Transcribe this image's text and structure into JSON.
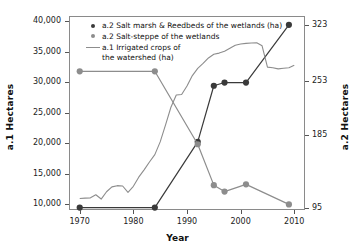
{
  "chart_data": {
    "type": "line",
    "title": "",
    "xlabel": "Year",
    "ylabel": "a.1 Hectares",
    "ylabel_right": "a.2 Hectares",
    "xlim": [
      1968,
      2012
    ],
    "ylim": [
      9000,
      40900
    ],
    "ylim_right": [
      92,
      334
    ],
    "grid": false,
    "legend_position": "top-left inside plot",
    "x_ticks": [
      1970,
      1980,
      1990,
      2000,
      2010
    ],
    "x_tick_labels": [
      "1970",
      "1980",
      "1990",
      "2000",
      "2010"
    ],
    "y_ticks_left": [
      10000,
      15000,
      20000,
      25000,
      30000,
      35000,
      40000
    ],
    "y_tick_labels_left": [
      "10,000",
      "15,000",
      "20,000",
      "25,000",
      "30,000",
      "35,000",
      "40,000"
    ],
    "y_ticks_right": [
      95,
      185,
      253,
      323
    ],
    "y_tick_labels_right": [
      "95",
      "185",
      "253",
      "323"
    ],
    "series": [
      {
        "name": "a.2 Salt marsh & Reedbeds of the wetlands (ha)",
        "axis": "right",
        "type": "line-markers",
        "color": "#3a3a3a",
        "marker": "circle",
        "x": [
          1970,
          1984,
          1992,
          1995,
          1997,
          2001,
          2009
        ],
        "values": [
          95,
          95,
          177,
          247,
          251,
          251,
          323
        ]
      },
      {
        "name": "a.2 Salt-steppe of the wetlands",
        "axis": "right",
        "type": "line-markers",
        "color": "#8d8d8d",
        "marker": "circle",
        "x": [
          1970,
          1984,
          1992,
          1995,
          1997,
          2001,
          2009
        ],
        "values": [
          265,
          265,
          174,
          123,
          115,
          124,
          99
        ]
      },
      {
        "name": "a.1 Irrigated crops of the watershed (ha)",
        "axis": "left",
        "type": "line",
        "color": "#8d8d8d",
        "marker": "none",
        "x": [
          1970,
          1971,
          1972,
          1973,
          1974,
          1975,
          1976,
          1977,
          1978,
          1979,
          1980,
          1981,
          1982,
          1983,
          1984,
          1985,
          1986,
          1987,
          1988,
          1989,
          1990,
          1991,
          1992,
          1993,
          1994,
          1995,
          1996,
          1997,
          1998,
          1999,
          2000,
          2001,
          2002,
          2003,
          2004,
          2005,
          2006,
          2007,
          2008,
          2009,
          2010
        ],
        "values": [
          10900,
          10950,
          11000,
          11500,
          10800,
          12000,
          12800,
          13000,
          12950,
          11900,
          12900,
          14400,
          15600,
          16900,
          18100,
          20200,
          23000,
          25900,
          27900,
          28000,
          29400,
          31100,
          32300,
          33100,
          34000,
          34600,
          34800,
          35100,
          35600,
          36100,
          36300,
          36400,
          36450,
          36500,
          36000,
          32500,
          32400,
          32200,
          32300,
          32400,
          32800
        ]
      }
    ],
    "notes": {
      "legend_line_1": "a.2 Salt marsh & Reedbeds of the wetlands (ha)",
      "legend_line_2": "a.2 Salt-steppe of the wetlands",
      "legend_line_3": "a.1 Irrigated crops of\nthe watershed (ha)"
    }
  }
}
